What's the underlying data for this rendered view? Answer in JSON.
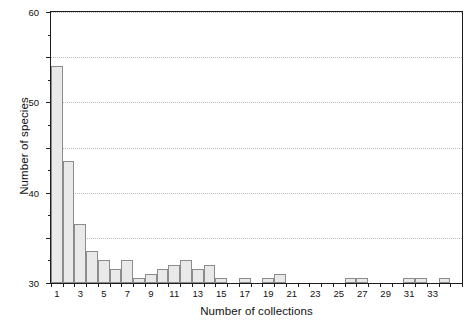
{
  "figure": {
    "title_remnant": "",
    "background_color": "#ffffff",
    "bar_fill_color": "#e9e9e9",
    "bar_border_color": "#8c8c8c",
    "axis_color": "#1c1c1c",
    "gridline_color": "#b9b9b9"
  },
  "chart_data": {
    "type": "bar",
    "title": "",
    "xlabel": "Number of collections",
    "ylabel": "Number of species",
    "xlim": [
      0,
      35
    ],
    "ylim": [
      0,
      60
    ],
    "grid": true,
    "legend": null,
    "y_ticks_major": [
      0,
      10,
      20,
      30,
      40,
      50,
      60
    ],
    "y_tick_labels": [
      "0",
      "10",
      "20",
      "30",
      "40",
      "50",
      "60"
    ],
    "y_ticks_minor": [
      5,
      15,
      25,
      35,
      45,
      55
    ],
    "x_tick_labels": [
      "1",
      "3",
      "5",
      "7",
      "9",
      "11",
      "13",
      "15",
      "17",
      "19",
      "21",
      "23",
      "25",
      "27",
      "29",
      "31",
      "33"
    ],
    "x_tick_values": [
      1,
      3,
      5,
      7,
      9,
      11,
      13,
      15,
      17,
      19,
      21,
      23,
      25,
      27,
      29,
      31,
      33
    ],
    "categories": [
      1,
      2,
      3,
      4,
      5,
      6,
      7,
      8,
      9,
      10,
      11,
      12,
      13,
      14,
      15,
      16,
      17,
      18,
      19,
      20,
      21,
      22,
      23,
      24,
      25,
      26,
      27,
      28,
      29,
      30,
      31,
      32,
      33,
      34
    ],
    "values": [
      48,
      27,
      13,
      7,
      5,
      3,
      5,
      1,
      2,
      3,
      4,
      5,
      3,
      4,
      1,
      0,
      1,
      0,
      1,
      2,
      0,
      0,
      0,
      0,
      0,
      1,
      1,
      0,
      0,
      0,
      1,
      1,
      0,
      1
    ]
  }
}
